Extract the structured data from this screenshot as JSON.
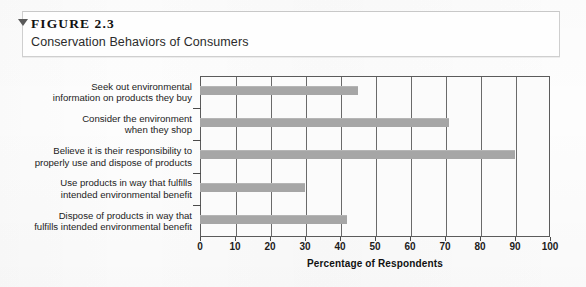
{
  "figure": {
    "marker_icon": "triangle-down-icon",
    "label": "FIGURE 2.3",
    "title": "Conservation Behaviors of Consumers"
  },
  "chart_data": {
    "type": "bar",
    "orientation": "horizontal",
    "title": "Conservation Behaviors of Consumers",
    "xlabel": "Percentage of Respondents",
    "ylabel": "",
    "xlim": [
      0,
      100
    ],
    "xticks": [
      0,
      10,
      20,
      30,
      40,
      50,
      60,
      70,
      80,
      90,
      100
    ],
    "grid": "vertical",
    "legend": "none",
    "bar_color": "#a6a6a6",
    "axis_color": "#5b5b5b",
    "categories": [
      "Seek out environmental information on products they buy",
      "Consider the environment when they shop",
      "Believe it is their responsibility to properly use and dispose of products",
      "Use products in way that fulfills intended environmental benefit",
      "Dispose of products in way that fulfills intended environmental benefit"
    ],
    "category_lines": [
      [
        "Seek out environmental",
        "information on products they buy"
      ],
      [
        "Consider the environment",
        "when they shop"
      ],
      [
        "Believe it is their responsibility to",
        "properly use and dispose of products"
      ],
      [
        "Use products in way that fulfills",
        "intended environmental benefit"
      ],
      [
        "Dispose of products in way that",
        "fulfills intended environmental benefit"
      ]
    ],
    "values": [
      45,
      71,
      90,
      30,
      42
    ]
  }
}
